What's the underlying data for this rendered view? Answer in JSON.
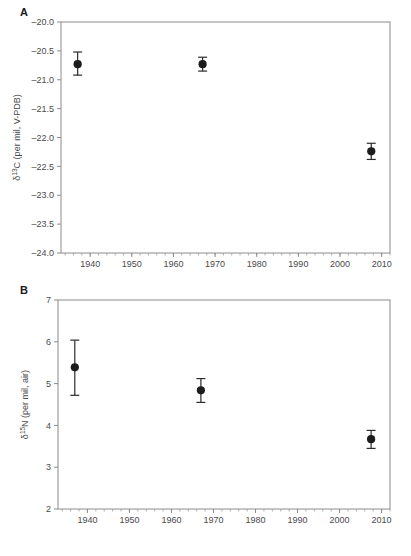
{
  "figure": {
    "panels": [
      {
        "id": "A",
        "letter": "A",
        "chart_index": 0
      },
      {
        "id": "B",
        "letter": "B",
        "chart_index": 1
      }
    ]
  },
  "chart_data": [
    {
      "panel": "A",
      "type": "scatter",
      "title": "",
      "xlabel": "",
      "ylabel": "δ¹³C (per mil, V-PDB)",
      "ylabel_parts": {
        "delta": "δ",
        "super": "13",
        "element": "C (per mil, V-PDB)"
      },
      "xlim": [
        1933,
        2012
      ],
      "ylim": [
        -24.0,
        -20.0
      ],
      "xticks": [
        1940,
        1950,
        1960,
        1970,
        1980,
        1990,
        2000,
        2010
      ],
      "xticklabels": [
        "1940",
        "1950",
        "1960",
        "1970",
        "1980",
        "1990",
        "2000",
        "2010"
      ],
      "xminor_step": 2,
      "yticks": [
        -24.0,
        -23.5,
        -23.0,
        -22.5,
        -22.0,
        -21.5,
        -21.0,
        -20.5,
        -20.0
      ],
      "yticklabels": [
        "–24.0",
        "–23.5",
        "–23.0",
        "–22.5",
        "–22.0",
        "–21.5",
        "–21.0",
        "–20.5",
        "–20.0"
      ],
      "grid": false,
      "legend": null,
      "x": [
        1937,
        1967,
        2007.5
      ],
      "values": [
        -20.73,
        -20.73,
        -22.24
      ],
      "yerr_low": [
        0.19,
        0.12,
        0.14
      ],
      "yerr_high": [
        0.21,
        0.12,
        0.14
      ],
      "points": [
        {
          "x": 1937,
          "y": -20.73,
          "err_low": -20.92,
          "err_high": -20.52
        },
        {
          "x": 1967,
          "y": -20.73,
          "err_low": -20.85,
          "err_high": -20.61
        },
        {
          "x": 2007.5,
          "y": -22.24,
          "err_low": -22.38,
          "err_high": -22.1
        }
      ],
      "marker": "filled-circle",
      "marker_color": "#1c1c1c"
    },
    {
      "panel": "B",
      "type": "scatter",
      "title": "",
      "xlabel": "",
      "ylabel": "δ¹⁵N (per mil, air)",
      "ylabel_parts": {
        "delta": "δ",
        "super": "15",
        "element": "N (per mil, air)"
      },
      "xlim": [
        1933,
        2012
      ],
      "ylim": [
        2,
        7
      ],
      "xticks": [
        1940,
        1950,
        1960,
        1970,
        1980,
        1990,
        2000,
        2010
      ],
      "xticklabels": [
        "1940",
        "1950",
        "1960",
        "1970",
        "1980",
        "1990",
        "2000",
        "2010"
      ],
      "xminor_step": 2,
      "yticks": [
        2,
        3,
        4,
        5,
        6,
        7
      ],
      "yticklabels": [
        "2",
        "3",
        "4",
        "5",
        "6",
        "7"
      ],
      "grid": false,
      "legend": null,
      "x": [
        1937,
        1967,
        2007.5
      ],
      "values": [
        5.39,
        4.84,
        3.67
      ],
      "yerr_low": [
        0.67,
        0.29,
        0.22
      ],
      "yerr_high": [
        0.65,
        0.28,
        0.21
      ],
      "points": [
        {
          "x": 1937,
          "y": 5.39,
          "err_low": 4.72,
          "err_high": 6.04
        },
        {
          "x": 1967,
          "y": 4.84,
          "err_low": 4.55,
          "err_high": 5.12
        },
        {
          "x": 2007.5,
          "y": 3.67,
          "err_low": 3.45,
          "err_high": 3.88
        }
      ],
      "marker": "filled-circle",
      "marker_color": "#1c1c1c"
    }
  ],
  "colors": {
    "axis": "#8c8c8c",
    "text": "#4a4a4a",
    "marker": "#1c1c1c",
    "background": "#ffffff"
  }
}
